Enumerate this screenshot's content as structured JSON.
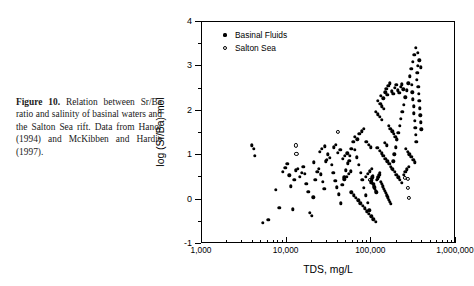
{
  "caption": {
    "label": "Figure 10.",
    "text": " Relation between Sr/Ba ratio and salinity of basinal waters and the Salton Sea rift. Data from Hanor (1994) and McKibben and Hardie (1997)."
  },
  "chart_data": {
    "type": "scatter",
    "title": "",
    "xlabel": "TDS, mg/L",
    "ylabel": "log (Sr/Ba) mol",
    "xscale": "log",
    "yscale": "linear",
    "xlim": [
      1000,
      1000000
    ],
    "ylim": [
      -1,
      4
    ],
    "xticks": [
      1000,
      10000,
      100000,
      1000000
    ],
    "xtick_labels": [
      "1,000",
      "10,000",
      "100,000",
      "1,000,000"
    ],
    "yticks": [
      -1,
      0,
      1,
      2,
      3,
      4
    ],
    "ytick_labels": [
      "-1",
      "0",
      "1",
      "2",
      "3",
      "4"
    ],
    "grid": false,
    "legend_position": "top-left",
    "series": [
      {
        "name": "Basinal Fluids",
        "marker": "filled-circle",
        "color": "#000000",
        "points": [
          [
            4100,
            1.15
          ],
          [
            4200,
            0.98
          ],
          [
            5200,
            -0.52
          ],
          [
            6100,
            -0.45
          ],
          [
            7400,
            0.22
          ],
          [
            8200,
            -0.18
          ],
          [
            9000,
            0.62
          ],
          [
            9600,
            0.72
          ],
          [
            10200,
            0.8
          ],
          [
            10800,
            0.55
          ],
          [
            11200,
            0.3
          ],
          [
            11800,
            -0.22
          ],
          [
            12300,
            0.45
          ],
          [
            12900,
            0.66
          ],
          [
            13600,
            0.7
          ],
          [
            14200,
            0.52
          ],
          [
            15000,
            0.61
          ],
          [
            15700,
            0.74
          ],
          [
            16300,
            0.58
          ],
          [
            17100,
            0.36
          ],
          [
            18000,
            0.18
          ],
          [
            18900,
            -0.3
          ],
          [
            19800,
            -0.36
          ],
          [
            20700,
            0.05
          ],
          [
            21800,
            0.44
          ],
          [
            22900,
            0.63
          ],
          [
            24000,
            0.7
          ],
          [
            25200,
            0.57
          ],
          [
            26500,
            0.4
          ],
          [
            27800,
            0.24
          ],
          [
            29200,
            0.86
          ],
          [
            30700,
            1.02
          ],
          [
            32300,
            0.94
          ],
          [
            33900,
            0.78
          ],
          [
            35600,
            0.6
          ],
          [
            37400,
            0.42
          ],
          [
            39300,
            0.28
          ],
          [
            41300,
            0.12
          ],
          [
            43400,
            -0.08
          ],
          [
            45600,
            0.34
          ],
          [
            47900,
            0.5
          ],
          [
            50300,
            0.66
          ],
          [
            52800,
            0.82
          ],
          [
            55500,
            0.98
          ],
          [
            58300,
            1.14
          ],
          [
            61200,
            1.3
          ],
          [
            64300,
            1.12
          ],
          [
            67500,
            0.95
          ],
          [
            70900,
            0.78
          ],
          [
            74500,
            0.61
          ],
          [
            78200,
            0.44
          ],
          [
            82100,
            0.27
          ],
          [
            86200,
            0.1
          ],
          [
            90500,
            -0.07
          ],
          [
            95100,
            -0.24
          ],
          [
            99900,
            0.38
          ],
          [
            100400,
            0.42
          ],
          [
            101200,
            0.46
          ],
          [
            102500,
            0.5
          ],
          [
            103800,
            0.54
          ],
          [
            105200,
            0.36
          ],
          [
            106800,
            0.32
          ],
          [
            108500,
            0.28
          ],
          [
            110300,
            0.24
          ],
          [
            112200,
            0.2
          ],
          [
            114300,
            0.16
          ],
          [
            116500,
            0.44
          ],
          [
            118800,
            0.48
          ],
          [
            121300,
            0.52
          ],
          [
            123900,
            0.56
          ],
          [
            126700,
            0.6
          ],
          [
            129600,
            0.4
          ],
          [
            132700,
            0.35
          ],
          [
            136000,
            0.3
          ],
          [
            139500,
            0.25
          ],
          [
            143200,
            0.2
          ],
          [
            147100,
            0.15
          ],
          [
            151200,
            0.1
          ],
          [
            155500,
            0.05
          ],
          [
            160100,
            0.0
          ],
          [
            165000,
            -0.05
          ],
          [
            170100,
            -0.1
          ],
          [
            175600,
            0.7
          ],
          [
            181400,
            0.86
          ],
          [
            187500,
            1.02
          ],
          [
            194000,
            1.18
          ],
          [
            200800,
            1.34
          ],
          [
            208000,
            1.5
          ],
          [
            215700,
            1.66
          ],
          [
            223800,
            1.82
          ],
          [
            232400,
            1.98
          ],
          [
            241500,
            2.14
          ],
          [
            251200,
            2.3
          ],
          [
            261400,
            2.46
          ],
          [
            272300,
            2.62
          ],
          [
            283800,
            2.78
          ],
          [
            296000,
            2.94
          ],
          [
            309000,
            3.1
          ],
          [
            322800,
            3.26
          ],
          [
            337400,
            3.42
          ],
          [
            352900,
            3.3
          ],
          [
            369400,
            3.14
          ],
          [
            386900,
            2.98
          ],
          [
            300000,
            2.58
          ],
          [
            305000,
            2.42
          ],
          [
            310000,
            2.26
          ],
          [
            315000,
            2.1
          ],
          [
            320000,
            1.94
          ],
          [
            325000,
            1.78
          ],
          [
            330000,
            1.62
          ],
          [
            335000,
            1.46
          ],
          [
            340000,
            1.3
          ],
          [
            345000,
            2.7
          ],
          [
            350000,
            2.86
          ],
          [
            355000,
            3.02
          ],
          [
            360000,
            2.54
          ],
          [
            365000,
            2.38
          ],
          [
            370000,
            2.22
          ],
          [
            375000,
            2.06
          ],
          [
            380000,
            1.9
          ],
          [
            385000,
            1.74
          ],
          [
            390000,
            1.58
          ],
          [
            150000,
            2.5
          ],
          [
            158000,
            2.56
          ],
          [
            166000,
            2.62
          ],
          [
            174000,
            2.44
          ],
          [
            182000,
            2.38
          ],
          [
            190000,
            2.52
          ],
          [
            198000,
            2.58
          ],
          [
            206000,
            2.46
          ],
          [
            214000,
            2.4
          ],
          [
            222000,
            2.54
          ],
          [
            230000,
            2.6
          ],
          [
            238000,
            2.48
          ],
          [
            130000,
            2.34
          ],
          [
            138000,
            2.28
          ],
          [
            146000,
            2.42
          ],
          [
            154000,
            2.36
          ],
          [
            120000,
            2.22
          ],
          [
            127000,
            2.16
          ],
          [
            134000,
            2.1
          ],
          [
            141000,
            2.04
          ],
          [
            112000,
            1.98
          ],
          [
            119000,
            1.92
          ],
          [
            126000,
            1.86
          ],
          [
            133000,
            1.8
          ],
          [
            160000,
            1.66
          ],
          [
            168000,
            1.6
          ],
          [
            176000,
            1.54
          ],
          [
            184000,
            1.48
          ],
          [
            192000,
            1.42
          ],
          [
            200000,
            1.36
          ],
          [
            144000,
            1.28
          ],
          [
            152000,
            1.22
          ],
          [
            118000,
            1.16
          ],
          [
            125000,
            1.1
          ],
          [
            132000,
            1.04
          ],
          [
            139000,
            0.98
          ],
          [
            147000,
            0.92
          ],
          [
            155000,
            0.86
          ],
          [
            163000,
            0.8
          ],
          [
            171000,
            0.74
          ],
          [
            180000,
            0.68
          ],
          [
            189000,
            0.62
          ],
          [
            198000,
            0.56
          ],
          [
            208000,
            0.5
          ],
          [
            218000,
            0.44
          ],
          [
            229000,
            0.38
          ],
          [
            240000,
            0.56
          ],
          [
            252000,
            0.62
          ],
          [
            264000,
            0.68
          ],
          [
            277000,
            0.74
          ],
          [
            58000,
            0.16
          ],
          [
            62000,
            0.1
          ],
          [
            66000,
            0.04
          ],
          [
            70000,
            -0.02
          ],
          [
            74000,
            -0.08
          ],
          [
            79000,
            -0.14
          ],
          [
            84000,
            -0.2
          ],
          [
            89000,
            -0.26
          ],
          [
            94000,
            -0.32
          ],
          [
            100000,
            -0.38
          ],
          [
            106000,
            -0.44
          ],
          [
            112000,
            -0.5
          ],
          [
            36000,
            1.18
          ],
          [
            38000,
            1.24
          ],
          [
            40000,
            1.06
          ],
          [
            43000,
            1.12
          ],
          [
            46000,
            0.92
          ],
          [
            49000,
            0.98
          ],
          [
            52000,
            1.04
          ],
          [
            55000,
            0.88
          ],
          [
            24500,
            1.08
          ],
          [
            26000,
            1.14
          ],
          [
            28000,
            1.2
          ],
          [
            30000,
            0.9
          ],
          [
            3900,
            1.22
          ],
          [
            21000,
            0.84
          ],
          [
            64000,
            1.42
          ],
          [
            68000,
            1.36
          ],
          [
            72000,
            1.48
          ],
          [
            77000,
            1.54
          ],
          [
            82000,
            1.6
          ],
          [
            87000,
            1.3
          ],
          [
            93000,
            1.24
          ],
          [
            99000,
            1.18
          ],
          [
            255000,
            1.14
          ],
          [
            268000,
            1.08
          ],
          [
            282000,
            1.02
          ],
          [
            296000,
            0.96
          ],
          [
            312000,
            0.9
          ],
          [
            328000,
            0.84
          ],
          [
            86000,
            0.52
          ],
          [
            91000,
            0.58
          ],
          [
            96000,
            0.64
          ],
          [
            102000,
            0.7
          ],
          [
            48000,
            0.46
          ],
          [
            51000,
            0.52
          ],
          [
            54000,
            0.58
          ],
          [
            57000,
            0.64
          ]
        ]
      },
      {
        "name": "Salton Sea",
        "marker": "open-circle",
        "color": "#000000",
        "points": [
          [
            12800,
            1.22
          ],
          [
            13000,
            1.02
          ],
          [
            40000,
            1.52
          ],
          [
            97000,
            0.44
          ],
          [
            250000,
            0.48
          ],
          [
            268000,
            0.46
          ],
          [
            272000,
            0.26
          ],
          [
            276000,
            0.04
          ]
        ]
      }
    ]
  }
}
